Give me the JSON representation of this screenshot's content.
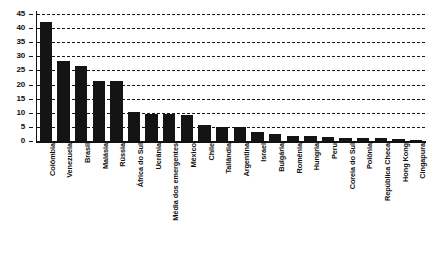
{
  "chart_data": {
    "type": "bar",
    "title": "",
    "subtitle": "",
    "xlabel": "",
    "ylabel": "",
    "ylim": [
      0,
      45
    ],
    "xlim_note": "categorical",
    "grid": true,
    "grid_axis": "y",
    "grid_style": "dashed",
    "legend": false,
    "legend_position": "none",
    "bar_color": "#141414",
    "axis_color": "#111111",
    "orientation": "vertical",
    "sorted": "descending",
    "y_ticks": [
      0,
      5,
      10,
      15,
      20,
      25,
      30,
      35,
      40,
      45
    ],
    "y_tick_labels": [
      "0",
      "5",
      "10",
      "15",
      "20",
      "25",
      "30",
      "35",
      "40",
      "45"
    ],
    "categories": [
      "Colômbia",
      "Venezuela",
      "Brasil",
      "Malásia",
      "Rússia",
      "África do Sul",
      "Ucrânia",
      "Média dos emergentes",
      "México",
      "Chile",
      "Tailândia",
      "Argentina",
      "Israel",
      "Bulgária",
      "Romênia",
      "Hungria",
      "Peru",
      "Coreia do Sul",
      "Polônia",
      "República Checa",
      "Hong Kong",
      "Cingapura"
    ],
    "values": [
      42.0,
      28.3,
      26.5,
      21.2,
      21.2,
      10.2,
      9.7,
      9.6,
      9.2,
      5.6,
      5.0,
      4.9,
      3.1,
      2.6,
      1.8,
      1.8,
      1.5,
      1.2,
      1.1,
      1.0,
      0.7,
      0.3
    ]
  }
}
